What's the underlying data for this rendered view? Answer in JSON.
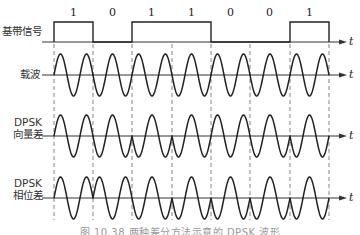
{
  "figure": {
    "caption": "图 10.38  两种差分方法示意的 DPSK 波形",
    "axis_label": "t",
    "rows": [
      {
        "id": "baseband",
        "label_lines": [
          "基带信号"
        ]
      },
      {
        "id": "carrier",
        "label_lines": [
          "载波"
        ]
      },
      {
        "id": "dpsk_vector",
        "label_lines": [
          "DPSK",
          "向量差"
        ]
      },
      {
        "id": "dpsk_phase",
        "label_lines": [
          "DPSK",
          "相位差"
        ]
      }
    ],
    "bits": [
      "1",
      "0",
      "1",
      "1",
      "0",
      "0",
      "1"
    ]
  },
  "chart_data": {
    "type": "waveform",
    "bits": [
      1,
      0,
      1,
      1,
      0,
      0,
      1
    ],
    "cycles_per_bit": 1.5,
    "x_start": 54,
    "bit_width": 39.3,
    "signals": [
      {
        "name": "基带信号",
        "kind": "nrz",
        "axis_y": 42,
        "high_y": 22
      },
      {
        "name": "载波",
        "kind": "sine",
        "axis_y": 75,
        "amplitude": 21,
        "phase_per_bit_deg": [
          0,
          0,
          0,
          0,
          0,
          0,
          0
        ]
      },
      {
        "name": "DPSK 向量差",
        "kind": "sine",
        "axis_y": 136,
        "amplitude": 21,
        "phase_per_bit_deg": [
          0,
          0,
          180,
          0,
          0,
          0,
          180
        ]
      },
      {
        "name": "DPSK 相位差",
        "kind": "sine",
        "axis_y": 198,
        "amplitude": 21,
        "phase_per_bit_deg": [
          0,
          180,
          180,
          0,
          180,
          0,
          180
        ]
      }
    ],
    "boundaries_x": [
      54,
      93,
      132,
      172,
      211,
      250,
      290,
      329
    ],
    "grid": "dashed vertical lines at bit boundaries",
    "colors": {
      "line": "#222222",
      "axis": "#333333",
      "dash": "#777777"
    }
  }
}
